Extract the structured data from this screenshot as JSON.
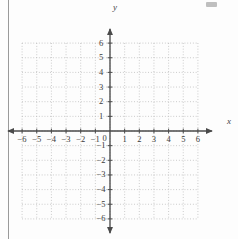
{
  "figure": {
    "kind": "cartesian-coordinate-grid",
    "background_color": "#fdfdfd",
    "axis_color": "#4a4a4a",
    "grid_color": "#b9b9b9",
    "label_color": "#3a3a3a"
  },
  "axes": {
    "x_label": "x",
    "y_label": "y",
    "origin_label": "0"
  },
  "chart_data": {
    "type": "scatter",
    "title": "",
    "xlabel": "x",
    "ylabel": "y",
    "xlim": [
      -6,
      6
    ],
    "ylim": [
      -6,
      6
    ],
    "xticks": [
      -6,
      -5,
      -4,
      -3,
      -2,
      -1,
      0,
      1,
      2,
      3,
      4,
      5,
      6
    ],
    "yticks": [
      -6,
      -5,
      -4,
      -3,
      -2,
      -1,
      0,
      1,
      2,
      3,
      4,
      5,
      6
    ],
    "xtick_labels": [
      "-6",
      "-5",
      "-4",
      "-3",
      "-2",
      "-1",
      "0",
      "1",
      "2",
      "3",
      "4",
      "5",
      "6"
    ],
    "ytick_labels": [
      "-6",
      "-5",
      "-4",
      "-3",
      "-2",
      "-1",
      "",
      "1",
      "2",
      "3",
      "4",
      "5",
      "6"
    ],
    "grid": true,
    "grid_style": "dotted",
    "grid_spacing": 1,
    "legend": false,
    "series": [],
    "x": [],
    "y": []
  },
  "annotations": {
    "arrow_ends": [
      "x-negative",
      "x-positive",
      "y-negative",
      "y-positive"
    ]
  }
}
